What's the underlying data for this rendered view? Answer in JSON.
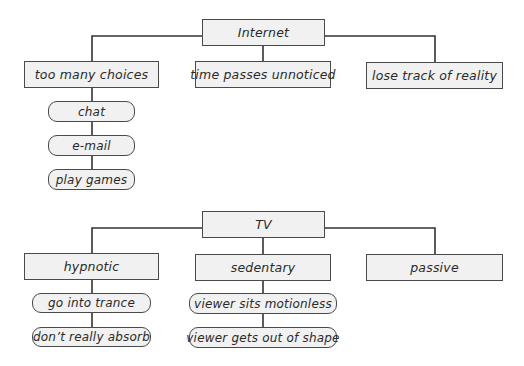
{
  "diagrams": [
    {
      "root": "Internet",
      "children": [
        {
          "label": "too many choices",
          "items": [
            "chat",
            "e-mail",
            "play games"
          ]
        },
        {
          "label": "time passes unnoticed",
          "items": []
        },
        {
          "label": "lose track of reality",
          "items": []
        }
      ]
    },
    {
      "root": "TV",
      "children": [
        {
          "label": "hypnotic",
          "items": [
            "go into trance",
            "don’t really absorb"
          ]
        },
        {
          "label": "sedentary",
          "items": [
            "viewer sits motionless",
            "viewer gets out of shape"
          ]
        },
        {
          "label": "passive",
          "items": []
        }
      ]
    }
  ],
  "colors": {
    "box_fill": "#f1f1f1",
    "box_border": "#4a4a4a",
    "line": "#333333",
    "text": "#2a2a2a"
  }
}
